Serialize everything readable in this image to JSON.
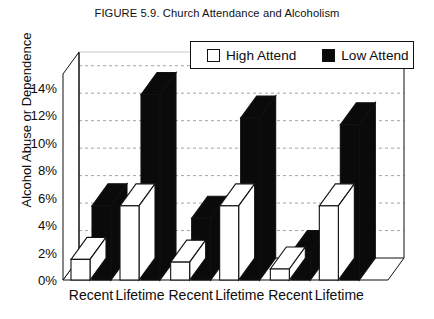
{
  "chart_data": {
    "type": "bar",
    "title": "FIGURE 5.9. Church Attendance and Alcoholism",
    "xlabel": "",
    "ylabel": "Alcohol Abuse or Dependence",
    "ylim": [
      0,
      15
    ],
    "ytick_labels": [
      "0%",
      "2%",
      "4%",
      "6%",
      "8%",
      "10%",
      "12%",
      "14%"
    ],
    "ytick_values": [
      0,
      2,
      4,
      6,
      8,
      10,
      12,
      14
    ],
    "grid": true,
    "legend_position": "top-right",
    "projection": "3d",
    "categories": [
      "Recent",
      "Lifetime",
      "Recent",
      "Lifetime",
      "Recent",
      "Lifetime"
    ],
    "groups": [
      {
        "label": "Group 1",
        "categories": [
          "Recent",
          "Lifetime"
        ]
      },
      {
        "label": "Group 2",
        "categories": [
          "Recent",
          "Lifetime"
        ]
      },
      {
        "label": "Group 3",
        "categories": [
          "Recent",
          "Lifetime"
        ]
      }
    ],
    "series": [
      {
        "name": "High Attend",
        "color": "#ffffff",
        "values": [
          1.5,
          5.4,
          1.3,
          5.4,
          0.8,
          5.4
        ]
      },
      {
        "name": "Low Attend",
        "color": "#0a0a0a",
        "values": [
          5.4,
          13.5,
          4.5,
          11.8,
          2.0,
          11.3
        ]
      }
    ]
  },
  "legend": {
    "high_label": "High Attend",
    "low_label": "Low Attend"
  },
  "axis": {
    "y_title": "Alcohol Abuse or Dependence"
  },
  "colors": {
    "high_attend": "#ffffff",
    "low_attend": "#0a0a0a",
    "outline": "#111111",
    "grid": "#9a9a9a",
    "background": "#ffffff"
  }
}
